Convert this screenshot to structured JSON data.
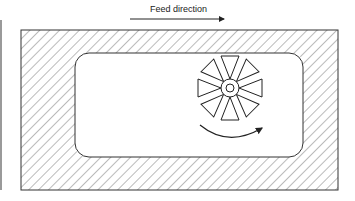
{
  "diagram": {
    "label": "Feed direction",
    "elements": {
      "feed_arrow": "arrow pointing right",
      "workpiece": "hatched rectangular block",
      "pocket": "rounded rectangular pocket",
      "cutter": "end mill cross-section with 8 triangular teeth",
      "rotation_arrow": "curved clockwise rotation arrow"
    }
  }
}
